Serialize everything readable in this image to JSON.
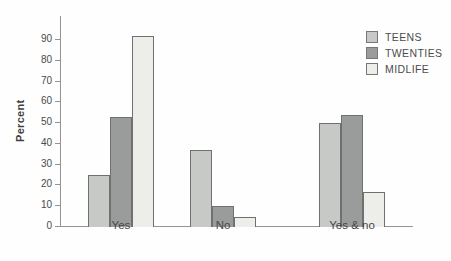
{
  "chart_data": {
    "type": "bar",
    "title": "",
    "categories": [
      "Yes",
      "No",
      "Yes & no"
    ],
    "series": [
      {
        "name": "TEENS",
        "color": "#c7c9c6",
        "values": [
          25,
          37,
          50
        ]
      },
      {
        "name": "TWENTIES",
        "color": "#9a9c9b",
        "values": [
          53,
          10,
          54
        ]
      },
      {
        "name": "MIDLIFE",
        "color": "#edeeea",
        "values": [
          92,
          5,
          17
        ]
      }
    ],
    "xlabel": "",
    "ylabel": "Percent",
    "ylim": [
      0,
      100
    ],
    "yticks": [
      0,
      10,
      20,
      30,
      40,
      50,
      60,
      70,
      80,
      90
    ],
    "grid": false,
    "legend_position": "top-right",
    "colors": {
      "axis": "#949494",
      "bar_border": "#707070",
      "text": "#474747",
      "background": "#fefefe"
    }
  }
}
